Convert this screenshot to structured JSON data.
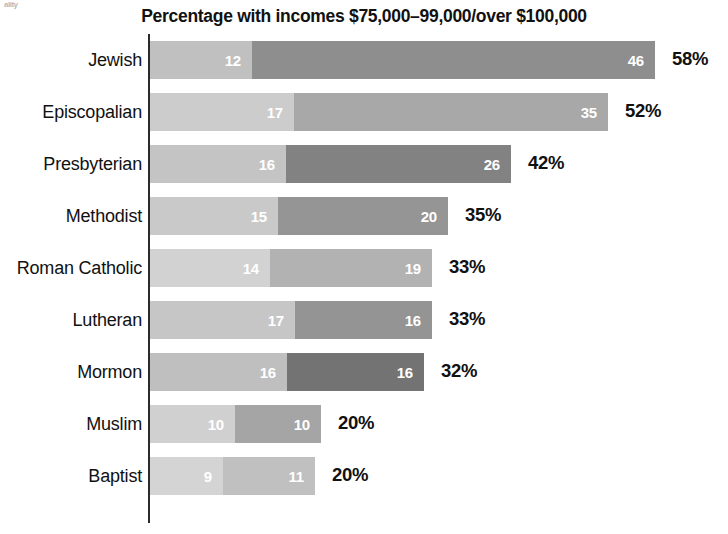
{
  "scan_artifact": "ality",
  "chart": {
    "title": "Percentage with incomes $75,000–99,000/over $100,000",
    "axis_color": "#2b2b2b"
  },
  "chart_data": {
    "type": "bar",
    "orientation": "horizontal",
    "stacked": true,
    "title": "Percentage with incomes $75,000–99,000/over $100,000",
    "xlabel": "",
    "ylabel": "",
    "xlim": [
      0,
      60
    ],
    "grid": false,
    "legend": "none",
    "categories": [
      "Jewish",
      "Episcopalian",
      "Presbyterian",
      "Methodist",
      "Roman Catholic",
      "Lutheran",
      "Mormon",
      "Muslim",
      "Baptist"
    ],
    "series": [
      {
        "name": "$75,000–99,000",
        "values": [
          12,
          17,
          16,
          15,
          14,
          17,
          16,
          10,
          9
        ]
      },
      {
        "name": "over $100,000",
        "values": [
          46,
          35,
          26,
          20,
          19,
          16,
          16,
          10,
          11
        ]
      }
    ],
    "totals": [
      58,
      52,
      42,
      35,
      33,
      33,
      32,
      20,
      20
    ],
    "total_labels": [
      "58%",
      "52%",
      "42%",
      "35%",
      "33%",
      "33%",
      "32%",
      "20%",
      "20%"
    ]
  },
  "rows": [
    {
      "label": "Jewish",
      "seg1_value": "12",
      "seg2_value": "46",
      "total_label": "58%",
      "seg1_width": 102,
      "seg2_width": 403,
      "seg1_color": "#c0c0c0",
      "seg2_color": "#8e8e8e"
    },
    {
      "label": "Episcopalian",
      "seg1_value": "17",
      "seg2_value": "35",
      "total_label": "52%",
      "seg1_width": 144,
      "seg2_width": 314,
      "seg1_color": "#cccccc",
      "seg2_color": "#a8a8a8"
    },
    {
      "label": "Presbyterian",
      "seg1_value": "16",
      "seg2_value": "26",
      "total_label": "42%",
      "seg1_width": 136,
      "seg2_width": 225,
      "seg1_color": "#c4c4c4",
      "seg2_color": "#828282"
    },
    {
      "label": "Methodist",
      "seg1_value": "15",
      "seg2_value": "20",
      "total_label": "35%",
      "seg1_width": 128,
      "seg2_width": 170,
      "seg1_color": "#c9c9c9",
      "seg2_color": "#959595"
    },
    {
      "label": "Roman Catholic",
      "seg1_value": "14",
      "seg2_value": "19",
      "total_label": "33%",
      "seg1_width": 120,
      "seg2_width": 162,
      "seg1_color": "#d2d2d2",
      "seg2_color": "#b2b2b2"
    },
    {
      "label": "Lutheran",
      "seg1_value": "17",
      "seg2_value": "16",
      "total_label": "33%",
      "seg1_width": 145,
      "seg2_width": 137,
      "seg1_color": "#c6c6c6",
      "seg2_color": "#949494"
    },
    {
      "label": "Mormon",
      "seg1_value": "16",
      "seg2_value": "16",
      "total_label": "32%",
      "seg1_width": 137,
      "seg2_width": 137,
      "seg1_color": "#bfbfbf",
      "seg2_color": "#737373"
    },
    {
      "label": "Muslim",
      "seg1_value": "10",
      "seg2_value": "10",
      "total_label": "20%",
      "seg1_width": 85,
      "seg2_width": 86,
      "seg1_color": "#d0d0d0",
      "seg2_color": "#a5a5a5"
    },
    {
      "label": "Baptist",
      "seg1_value": "9",
      "seg2_value": "11",
      "total_label": "20%",
      "seg1_width": 73,
      "seg2_width": 92,
      "seg1_color": "#d4d4d4",
      "seg2_color": "#c0c0c0"
    }
  ]
}
